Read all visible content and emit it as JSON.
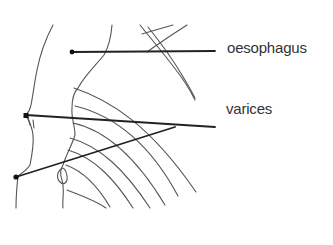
{
  "diagram": {
    "labels": [
      {
        "id": "oesophagus",
        "text": "oesophagus",
        "x": 227,
        "y": 40
      },
      {
        "id": "varices",
        "text": "varices",
        "x": 226,
        "y": 101
      }
    ],
    "leader_lines": [
      {
        "target": "oesophagus",
        "from": [
          72,
          52
        ],
        "to": [
          215,
          51
        ]
      },
      {
        "target": "varices",
        "from": [
          26,
          115
        ],
        "to": [
          215,
          127
        ]
      },
      {
        "target": "varices",
        "from": [
          16,
          177
        ],
        "to": [
          175,
          127
        ]
      }
    ],
    "colors": {
      "background": "#ffffff",
      "outline": "#555555",
      "leader": "#222222",
      "text": "#333333"
    }
  }
}
